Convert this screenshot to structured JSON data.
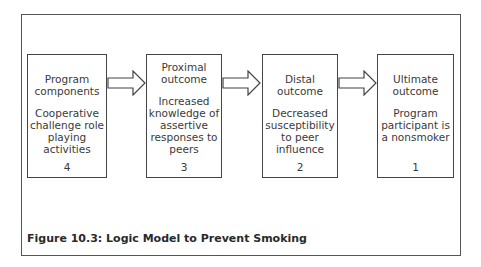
{
  "figure": {
    "caption": "Figure 10.3: Logic Model to Prevent Smoking",
    "boxes": [
      {
        "title": "Program components",
        "description": "Cooperative challenge role playing activities",
        "number": "4"
      },
      {
        "title": "Proximal outcome",
        "description": "Increased knowledge of assertive responses to peers",
        "number": "3"
      },
      {
        "title": "Distal outcome",
        "description": "Decreased susceptibility to peer influence",
        "number": "2"
      },
      {
        "title": "Ultimate outcome",
        "description": "Program participant is a nonsmoker",
        "number": "1"
      }
    ],
    "arrows": [
      "right-arrow",
      "right-arrow",
      "right-arrow"
    ],
    "colors": {
      "border": "#444444",
      "text": "#3a3a3a",
      "background": "#ffffff"
    }
  }
}
